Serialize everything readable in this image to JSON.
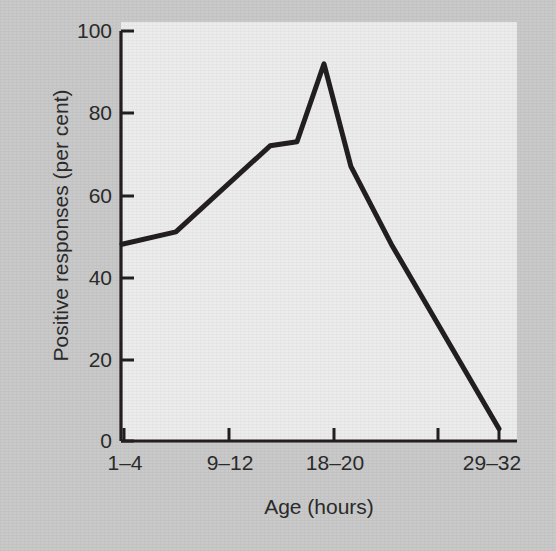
{
  "figure": {
    "background_color": "#c9c9c9",
    "panel_color": "#ececec",
    "ink_color": "#231f20"
  },
  "chart_data": {
    "type": "line",
    "title": "",
    "subtitle": "",
    "xlabel": "Age (hours)",
    "ylabel": "Positive responses (per cent)",
    "ylim": [
      0,
      100
    ],
    "grid": false,
    "legend": false,
    "legend_position": "none",
    "y_ticks": [
      0,
      20,
      40,
      60,
      80,
      100
    ],
    "y_tick_labels": [
      "0",
      "20",
      "40",
      "60",
      "80",
      "100"
    ],
    "x_tick_labels": [
      "1–4",
      "9–12",
      "18–20",
      "29–32"
    ],
    "x_tick_label_positions": [
      1,
      9,
      18,
      29
    ],
    "x_unlabelled_tick_positions": [
      25
    ],
    "x_axis_units": "hours of age",
    "series": [
      {
        "name": "Positive responses",
        "color": "#231f20",
        "line_width": 5,
        "x": [
          1,
          5,
          12,
          14,
          16,
          18,
          21,
          29
        ],
        "x_labels": [
          "1–4",
          "5–8",
          "12–14",
          "14–16",
          "16–17",
          "17–18",
          "21–24",
          "29–32"
        ],
        "values": [
          48,
          51,
          72,
          73,
          92,
          67,
          48,
          3
        ]
      }
    ]
  },
  "axis": {
    "y_title": "Positive responses (per cent)",
    "x_title": "Age (hours)"
  },
  "y_tick_items": [
    {
      "label": "100",
      "value": 100
    },
    {
      "label": "80",
      "value": 80
    },
    {
      "label": "60",
      "value": 60
    },
    {
      "label": "40",
      "value": 40
    },
    {
      "label": "20",
      "value": 20
    },
    {
      "label": "0",
      "value": 0
    }
  ],
  "x_tick_items": [
    {
      "label": "1–4"
    },
    {
      "label": "9–12"
    },
    {
      "label": "18–20"
    },
    {
      "label": "29–32"
    }
  ]
}
